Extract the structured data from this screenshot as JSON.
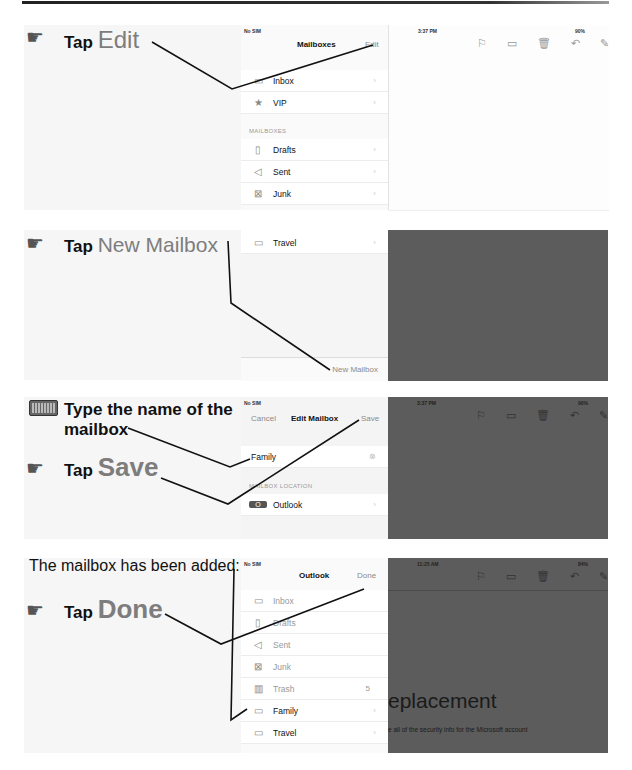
{
  "steps": [
    {
      "instruction": {
        "prefix": "Tap",
        "target": "Edit"
      },
      "screen": {
        "status_left": "No SIM",
        "status_time": "3:37 PM",
        "status_battery": "90%",
        "nav_title": "Mailboxes",
        "nav_right": "Edit",
        "rows_top": [
          {
            "icon": "inbox-icon",
            "label": "Inbox"
          },
          {
            "icon": "star-icon",
            "label": "VIP"
          }
        ],
        "section_header": "MAILBOXES",
        "rows": [
          {
            "icon": "drafts-icon",
            "label": "Drafts"
          },
          {
            "icon": "sent-icon",
            "label": "Sent"
          },
          {
            "icon": "junk-icon",
            "label": "Junk"
          }
        ]
      }
    },
    {
      "instruction": {
        "prefix": "Tap",
        "target": "New Mailbox"
      },
      "screen": {
        "rows": [
          {
            "icon": "folder-icon",
            "label": "Travel"
          }
        ],
        "bottom_button": "New Mailbox"
      }
    },
    {
      "instruction": {
        "line1": "Type the name of the",
        "line2": "mailbox",
        "prefix": "Tap",
        "target": "Save"
      },
      "screen": {
        "status_left": "No SIM",
        "status_time": "3:37 PM",
        "status_battery": "90%",
        "nav_left": "Cancel",
        "nav_title": "Edit Mailbox",
        "nav_right": "Save",
        "name_value": "Family",
        "section_header": "MAILBOX LOCATION",
        "location": "Outlook"
      }
    },
    {
      "instruction": {
        "note": "The mailbox has been added:",
        "prefix": "Tap",
        "target": "Done"
      },
      "screen": {
        "status_left": "No SIM",
        "status_time": "11:25 AM",
        "status_battery": "84%",
        "nav_title": "Outlook",
        "nav_right": "Done",
        "rows": [
          {
            "icon": "inbox-icon",
            "label": "Inbox",
            "count": ""
          },
          {
            "icon": "drafts-icon",
            "label": "Drafts",
            "count": ""
          },
          {
            "icon": "sent-icon",
            "label": "Sent",
            "count": ""
          },
          {
            "icon": "junk-icon",
            "label": "Junk",
            "count": ""
          },
          {
            "icon": "trash-icon",
            "label": "Trash",
            "count": "5"
          },
          {
            "icon": "folder-icon",
            "label": "Family",
            "count": ""
          },
          {
            "icon": "folder-icon",
            "label": "Travel",
            "count": ""
          }
        ],
        "bg_heading": "eplacement",
        "bg_text": "e all of the security info for the Microsoft account"
      }
    }
  ]
}
